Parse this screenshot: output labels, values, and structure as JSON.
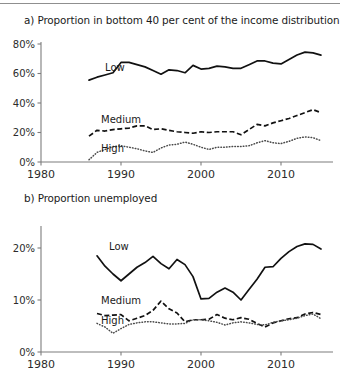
{
  "figure": {
    "has_top_rule": true,
    "background": "#ffffff",
    "ink_color": "#111111"
  },
  "panels": [
    {
      "id": "a",
      "title": "a) Proportion in bottom 40 per cent of the income distribution"
    },
    {
      "id": "b",
      "title": "b) Proportion unemployed"
    }
  ],
  "chart_data": [
    {
      "type": "line",
      "title": "a) Proportion in bottom 40 per cent of the income distribution",
      "xlabel": "",
      "ylabel": "",
      "xlim": [
        1980,
        2015
      ],
      "ylim": [
        0,
        80
      ],
      "xticks": [
        1980,
        1990,
        2000,
        2010
      ],
      "xtick_labels": [
        "1980",
        "1990",
        "2000",
        "2010"
      ],
      "yticks": [
        0,
        20,
        40,
        60,
        80
      ],
      "ytick_labels": [
        "0%",
        "20%",
        "40%",
        "60%",
        "80%"
      ],
      "grid": false,
      "legend": "inline-labels",
      "annotations": [
        {
          "text": "Low",
          "x": 1988.0,
          "y": 61.5
        },
        {
          "text": "Medium",
          "x": 1987.5,
          "y": 26.5
        },
        {
          "text": "High",
          "x": 1987.5,
          "y": 6.5
        }
      ],
      "x": [
        1986,
        1987,
        1988,
        1989,
        1990,
        1991,
        1992,
        1993,
        1994,
        1995,
        1996,
        1997,
        1998,
        1999,
        2000,
        2001,
        2002,
        2003,
        2004,
        2005,
        2006,
        2007,
        2008,
        2009,
        2010,
        2011,
        2012,
        2013,
        2014,
        2015
      ],
      "series": [
        {
          "name": "Low",
          "style": "solid",
          "values": [
            55.5,
            57.5,
            59.0,
            60.5,
            67.5,
            67.5,
            66.0,
            64.5,
            62.0,
            59.5,
            62.5,
            62.0,
            60.5,
            65.5,
            63.0,
            63.5,
            65.0,
            64.5,
            63.5,
            63.5,
            66.0,
            68.5,
            68.5,
            67.0,
            66.5,
            69.5,
            72.5,
            74.5,
            74.0,
            72.5
          ]
        },
        {
          "name": "Medium",
          "style": "dashed",
          "values": [
            17.5,
            21.5,
            21.0,
            22.0,
            22.5,
            23.0,
            24.5,
            24.5,
            22.0,
            22.5,
            21.5,
            20.5,
            20.0,
            19.5,
            20.5,
            20.0,
            20.5,
            20.5,
            20.5,
            18.5,
            22.0,
            25.5,
            24.5,
            26.5,
            28.0,
            29.5,
            31.5,
            33.5,
            35.5,
            33.5
          ]
        },
        {
          "name": "High",
          "style": "dotted",
          "values": [
            1.5,
            6.5,
            8.5,
            10.5,
            11.0,
            10.0,
            9.0,
            7.5,
            6.5,
            9.5,
            11.5,
            12.0,
            13.5,
            12.0,
            10.0,
            8.5,
            10.0,
            10.0,
            10.5,
            10.5,
            11.0,
            13.0,
            14.5,
            13.0,
            12.5,
            14.0,
            16.0,
            17.0,
            16.5,
            14.5
          ]
        }
      ]
    },
    {
      "type": "line",
      "title": "b) Proportion unemployed",
      "xlabel": "",
      "ylabel": "",
      "xlim": [
        1980,
        2015
      ],
      "ylim": [
        0,
        23
      ],
      "xticks": [
        1980,
        1990,
        2000,
        2010
      ],
      "xtick_labels": [
        "1980",
        "1990",
        "2000",
        "2010"
      ],
      "yticks": [
        0,
        10,
        20
      ],
      "ytick_labels": [
        "0%",
        "10%",
        "20%"
      ],
      "grid": false,
      "legend": "inline-labels",
      "annotations": [
        {
          "text": "Low",
          "x": 1988.5,
          "y": 19.6
        },
        {
          "text": "Medium",
          "x": 1987.5,
          "y": 9.2
        },
        {
          "text": "High",
          "x": 1987.5,
          "y": 5.4
        }
      ],
      "x": [
        1987,
        1988,
        1989,
        1990,
        1991,
        1992,
        1993,
        1994,
        1995,
        1996,
        1997,
        1998,
        1999,
        2000,
        2001,
        2002,
        2003,
        2004,
        2005,
        2006,
        2007,
        2008,
        2009,
        2010,
        2011,
        2012,
        2013,
        2014,
        2015
      ],
      "series": [
        {
          "name": "Low",
          "style": "solid",
          "values": [
            18.5,
            16.5,
            15.0,
            13.7,
            15.0,
            16.3,
            17.2,
            18.4,
            17.0,
            16.0,
            17.8,
            16.8,
            14.5,
            10.2,
            10.3,
            11.5,
            12.3,
            11.5,
            10.0,
            12.0,
            14.0,
            16.3,
            16.4,
            18.0,
            19.3,
            20.3,
            20.8,
            20.7,
            19.8
          ]
        },
        {
          "name": "Medium",
          "style": "dashed",
          "values": [
            7.4,
            7.0,
            7.1,
            7.2,
            6.0,
            6.5,
            7.0,
            8.0,
            9.8,
            8.3,
            7.5,
            5.8,
            6.2,
            6.2,
            6.3,
            7.2,
            6.5,
            6.2,
            6.6,
            6.3,
            5.5,
            4.8,
            5.6,
            6.0,
            6.4,
            6.6,
            7.3,
            7.6,
            7.2
          ]
        },
        {
          "name": "High",
          "style": "dotted",
          "values": [
            5.5,
            4.8,
            3.6,
            4.5,
            5.3,
            5.6,
            5.8,
            5.8,
            5.6,
            5.4,
            5.4,
            5.5,
            6.2,
            6.2,
            6.0,
            5.7,
            5.2,
            5.6,
            5.8,
            5.6,
            5.3,
            5.2,
            5.7,
            6.0,
            6.2,
            6.5,
            7.0,
            7.3,
            6.4
          ]
        }
      ]
    }
  ]
}
